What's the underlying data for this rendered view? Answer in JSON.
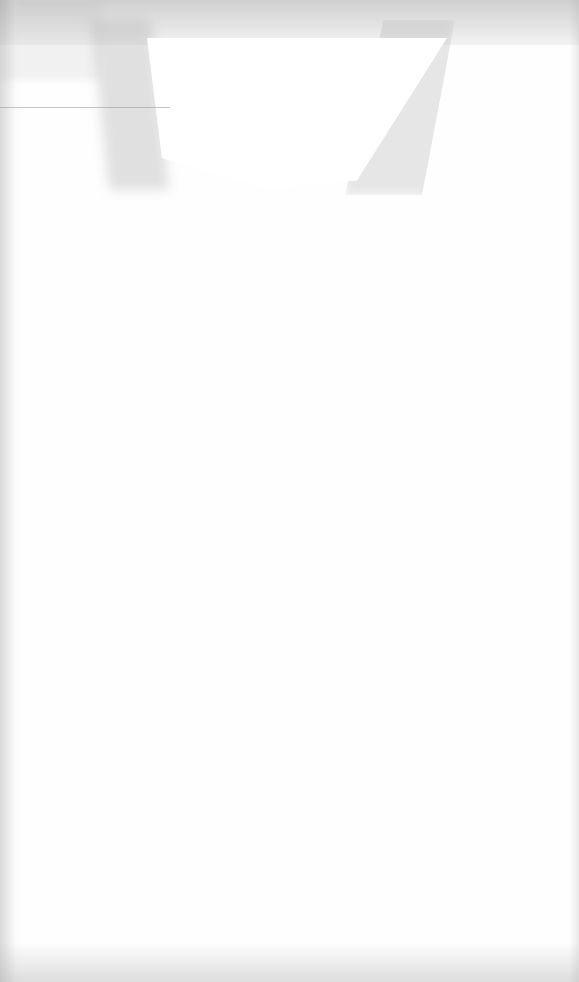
{
  "document": {
    "type": "scanned-page",
    "content_status": "blank",
    "visible_text": []
  },
  "colors": {
    "paper": "#fefefe",
    "smudge": "#a8a8a8"
  }
}
